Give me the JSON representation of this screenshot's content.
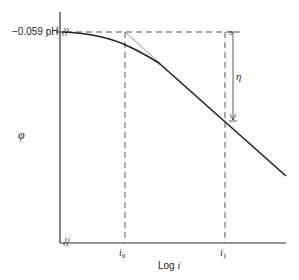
{
  "diagram": {
    "y_axis": {
      "label": "φ",
      "tick_label": "−0.059 pH"
    },
    "x_axis": {
      "label_prefix": "Log ",
      "label_var": "i",
      "ticks": [
        {
          "base": "i",
          "sub": "0"
        },
        {
          "base": "i",
          "sub": "1"
        }
      ]
    },
    "annotations": {
      "overpotential": "η"
    },
    "colors": {
      "line": "#222222",
      "dashed": "#444444",
      "background": "#ffffff"
    }
  }
}
